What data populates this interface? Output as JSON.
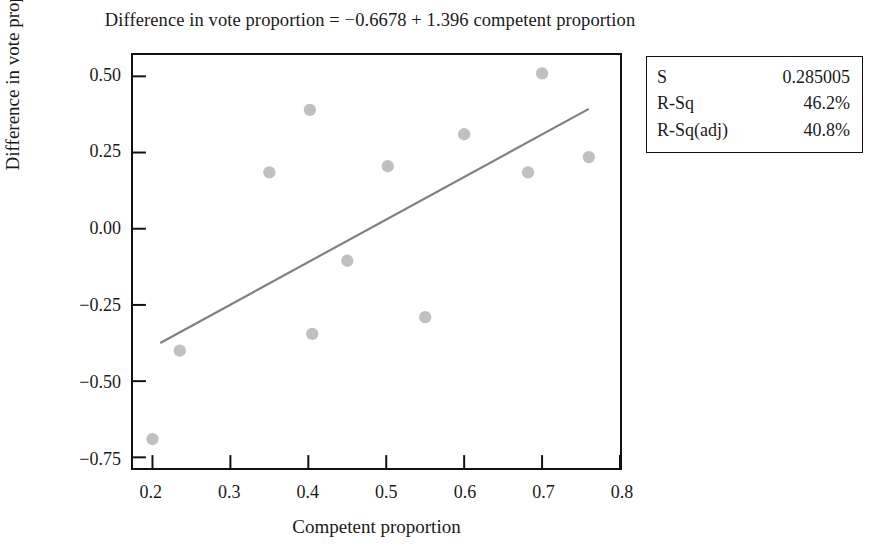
{
  "chart_data": {
    "type": "scatter",
    "title": "Difference in vote proportion = −0.6678 + 1.396 competent proportion",
    "xlabel": "Competent proportion",
    "ylabel": "Difference in vote proportion",
    "xlim": [
      0.175,
      0.8
    ],
    "ylim": [
      -0.785,
      0.57
    ],
    "xticks": [
      "0.2",
      "0.3",
      "0.4",
      "0.5",
      "0.6",
      "0.7",
      "0.8"
    ],
    "xtick_values": [
      0.2,
      0.3,
      0.4,
      0.5,
      0.6,
      0.7,
      0.8
    ],
    "yticks": [
      "0.50",
      "0.25",
      "0.00",
      "−0.25",
      "−0.50",
      "−0.75"
    ],
    "ytick_values": [
      0.5,
      0.25,
      0.0,
      -0.25,
      -0.5,
      -0.75
    ],
    "grid": false,
    "legend": "none",
    "point_color": "#c0c0c0",
    "line_color": "#808080",
    "axis_color": "#111111",
    "points": [
      {
        "x": 0.2,
        "y": -0.69
      },
      {
        "x": 0.235,
        "y": -0.4
      },
      {
        "x": 0.35,
        "y": 0.185
      },
      {
        "x": 0.402,
        "y": 0.39
      },
      {
        "x": 0.405,
        "y": -0.345
      },
      {
        "x": 0.45,
        "y": -0.105
      },
      {
        "x": 0.502,
        "y": 0.205
      },
      {
        "x": 0.55,
        "y": -0.29
      },
      {
        "x": 0.6,
        "y": 0.31
      },
      {
        "x": 0.682,
        "y": 0.185
      },
      {
        "x": 0.7,
        "y": 0.51
      },
      {
        "x": 0.76,
        "y": 0.235
      }
    ],
    "fit_line": {
      "intercept": -0.6678,
      "slope": 1.396,
      "x_start": 0.21,
      "x_end": 0.76
    }
  },
  "stats_box": {
    "rows": [
      {
        "key": "S",
        "value": "0.285005"
      },
      {
        "key": "R-Sq",
        "value": "46.2%"
      },
      {
        "key": "R-Sq(adj)",
        "value": "40.8%"
      }
    ]
  }
}
